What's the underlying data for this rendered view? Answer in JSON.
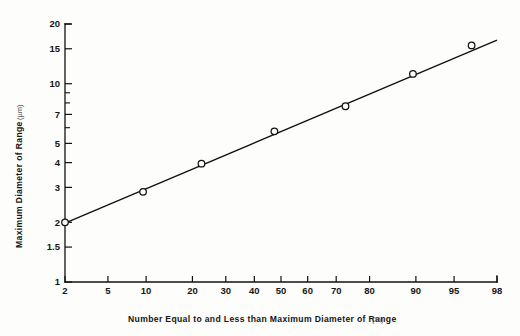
{
  "figure": {
    "background_color": "#fdfdfb",
    "ink_color": "#111111",
    "xlabel_main": "Number  Equal  to  and  Less  than  Maximum Diameter of Range",
    "xlabel_unit": "(%)",
    "ylabel_main": "Maximum Diameter of Range",
    "ylabel_unit": "(µm)"
  },
  "chart_data": {
    "type": "scatter",
    "title": "",
    "xlabel": "Number Equal to and Less than Maximum Diameter of Range (%)",
    "ylabel": "Maximum Diameter of Range (µm)",
    "xscale": "probability",
    "yscale": "log",
    "xlim": [
      2,
      98
    ],
    "ylim": [
      1,
      20
    ],
    "grid": false,
    "legend": "none",
    "x": [
      2,
      9.5,
      22.5,
      47.5,
      73,
      89.5,
      96.5
    ],
    "y": [
      2.0,
      2.85,
      3.95,
      5.75,
      7.7,
      11.2,
      15.6
    ],
    "points": [
      {
        "x": 2,
        "y": 2.0
      },
      {
        "x": 9.5,
        "y": 2.85
      },
      {
        "x": 22.5,
        "y": 3.95
      },
      {
        "x": 47.5,
        "y": 5.75
      },
      {
        "x": 73,
        "y": 7.7
      },
      {
        "x": 89.5,
        "y": 11.2
      },
      {
        "x": 96.5,
        "y": 15.6
      }
    ],
    "fit_line": {
      "type": "log-probability straight line",
      "x_endpoints": [
        2,
        98
      ],
      "y_endpoints": [
        1.98,
        16.6
      ]
    },
    "xticks": [
      2,
      5,
      10,
      20,
      30,
      40,
      50,
      60,
      70,
      80,
      90,
      95,
      98
    ],
    "xtick_labels": [
      "2",
      "5",
      "10",
      "20",
      "30",
      "40",
      "50",
      "60",
      "70",
      "80",
      "90",
      "95",
      "98"
    ],
    "yticks_major": [
      1,
      1.5,
      2,
      3,
      4,
      5,
      7,
      10,
      15,
      20
    ],
    "ytick_labels": [
      "1",
      "1.5",
      "2",
      "3",
      "4",
      "5",
      "7",
      "10",
      "15",
      "20"
    ],
    "yticks_minor": [
      6,
      8,
      9
    ]
  },
  "geometry": {
    "x_axis_y": 282,
    "y_axis_x": 65,
    "x_axis_left": 65,
    "x_axis_right": 497,
    "y_axis_top": 24,
    "y_axis_bottom": 282
  }
}
